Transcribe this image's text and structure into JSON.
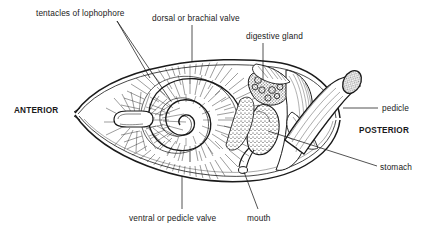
{
  "figure": {
    "type": "anatomical-line-diagram",
    "background_color": "#ffffff",
    "ink_color": "#1a1a1a"
  },
  "labels": {
    "tentacles": "tentacles of lophophore",
    "dorsal_valve": "dorsal or brachial valve",
    "digestive_gland": "digestive gland",
    "pedicle": "pedicle",
    "stomach": "stomach",
    "mouth": "mouth",
    "ventral_valve": "ventral or pedicle valve",
    "anterior": "ANTERIOR",
    "posterior": "POSTERIOR"
  },
  "label_positions": {
    "tentacles": {
      "x": 36,
      "y": 9
    },
    "dorsal_valve": {
      "x": 152,
      "y": 14
    },
    "digestive_gland": {
      "x": 246,
      "y": 32
    },
    "pedicle": {
      "x": 382,
      "y": 104
    },
    "stomach": {
      "x": 380,
      "y": 163
    },
    "mouth": {
      "x": 247,
      "y": 214
    },
    "ventral_valve": {
      "x": 129,
      "y": 214
    },
    "anterior": {
      "x": 14,
      "y": 107
    },
    "posterior": {
      "x": 359,
      "y": 127
    }
  }
}
